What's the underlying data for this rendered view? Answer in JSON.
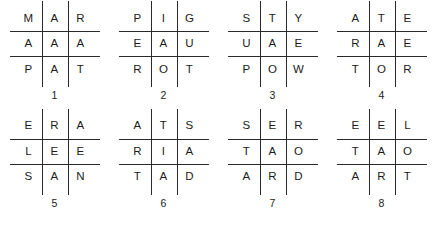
{
  "sheet": {
    "title": "Letter Grid Puzzle Sheet",
    "grid_count": 8,
    "rows_per_grid": 3,
    "columns_per_grid": 3,
    "ink_color": "#1b1b1b",
    "rule_color": "#2a2a2a",
    "background_color": "#ffffff"
  },
  "grids": [
    {
      "number": "1",
      "rows": [
        [
          "M",
          "A",
          "R"
        ],
        [
          "A",
          "A",
          "A"
        ],
        [
          "P",
          "A",
          "T"
        ]
      ]
    },
    {
      "number": "2",
      "rows": [
        [
          "P",
          "I",
          "G"
        ],
        [
          "E",
          "A",
          "U"
        ],
        [
          "R",
          "O",
          "T"
        ]
      ]
    },
    {
      "number": "3",
      "rows": [
        [
          "S",
          "T",
          "Y"
        ],
        [
          "U",
          "A",
          "E"
        ],
        [
          "P",
          "O",
          "W"
        ]
      ]
    },
    {
      "number": "4",
      "rows": [
        [
          "A",
          "T",
          "E"
        ],
        [
          "R",
          "A",
          "E"
        ],
        [
          "T",
          "O",
          "R"
        ]
      ]
    },
    {
      "number": "5",
      "rows": [
        [
          "E",
          "R",
          "A"
        ],
        [
          "L",
          "E",
          "E"
        ],
        [
          "S",
          "A",
          "N"
        ]
      ]
    },
    {
      "number": "6",
      "rows": [
        [
          "A",
          "T",
          "S"
        ],
        [
          "R",
          "I",
          "A"
        ],
        [
          "T",
          "A",
          "D"
        ]
      ]
    },
    {
      "number": "7",
      "rows": [
        [
          "S",
          "E",
          "R"
        ],
        [
          "T",
          "A",
          "O"
        ],
        [
          "A",
          "R",
          "D"
        ]
      ]
    },
    {
      "number": "8",
      "rows": [
        [
          "E",
          "E",
          "L"
        ],
        [
          "T",
          "A",
          "O"
        ],
        [
          "A",
          "R",
          "T"
        ]
      ]
    }
  ]
}
